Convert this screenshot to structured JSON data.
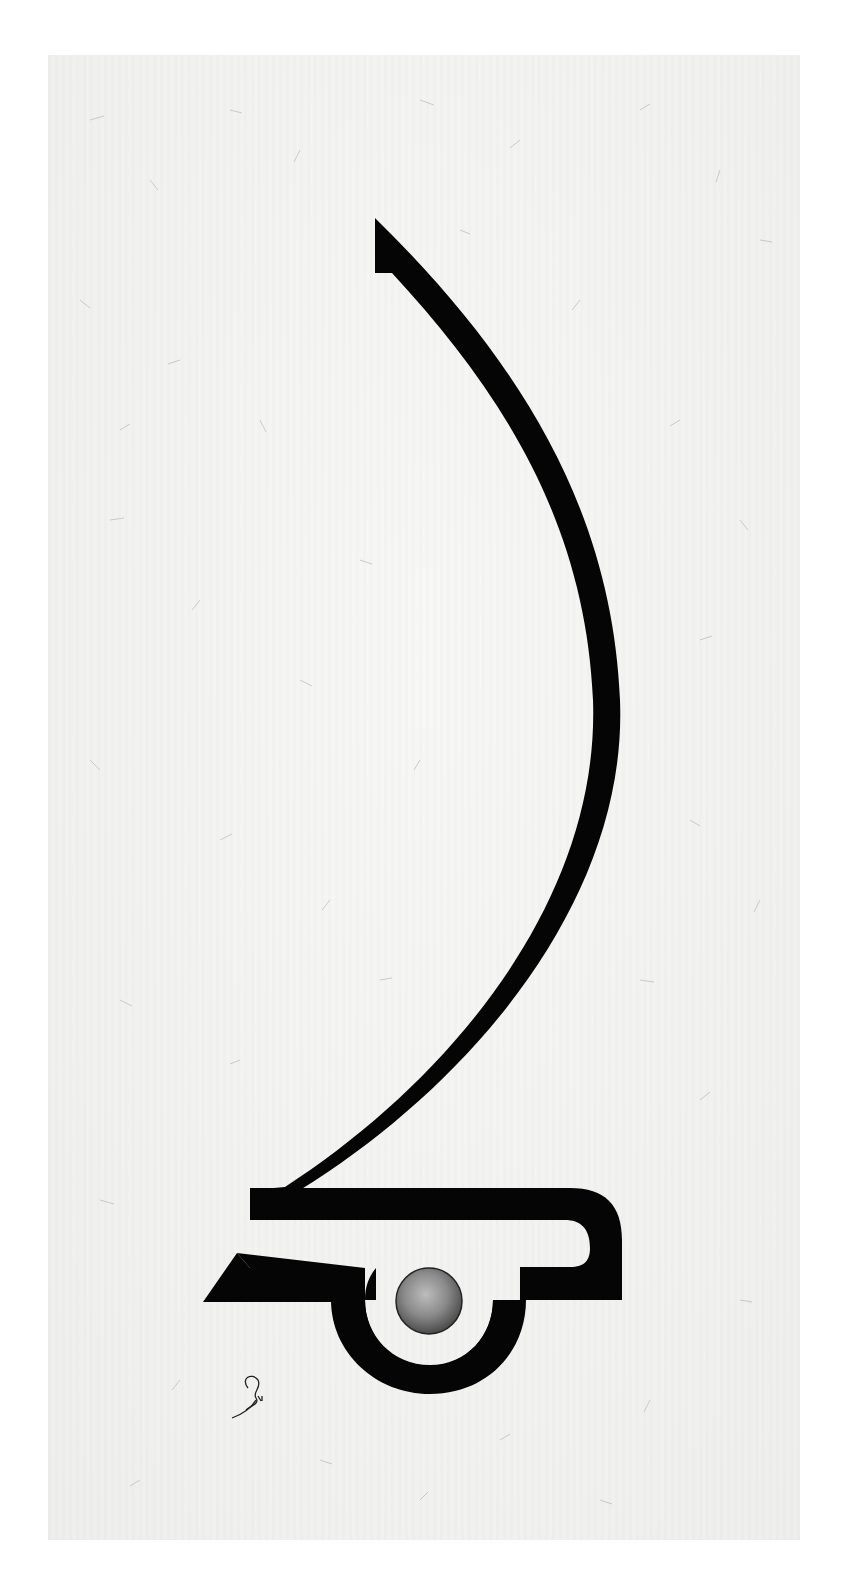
{
  "artwork": {
    "type": "calligraphy",
    "medium": "black ink stroke on fibrous paper with metallic circle",
    "colors": {
      "background": "#ffffff",
      "paper": "#f1f1ef",
      "ink": "#050505",
      "circle_light": "#bdbdbd",
      "circle_dark": "#4a4a4a",
      "fiber": "#b8b8b8"
    },
    "signature_label": "artist signature"
  }
}
